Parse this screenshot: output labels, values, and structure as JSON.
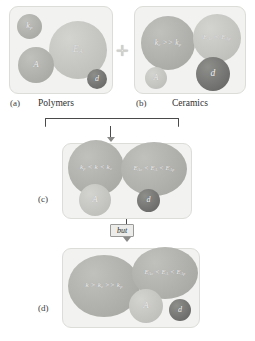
{
  "figure": {
    "type": "four-panel-schematic"
  },
  "panels": [
    {
      "id": "a",
      "panel_letter": "(a)",
      "caption": "Polymers",
      "bubbles": [
        {
          "name": "k-p",
          "label": "k",
          "sub": "p",
          "tone": "mid"
        },
        {
          "name": "activation-energy",
          "label": "E",
          "sub": "A",
          "tone": "light"
        },
        {
          "name": "area",
          "label": "A",
          "sub": "",
          "tone": "mid"
        },
        {
          "name": "thickness",
          "label": "d",
          "sub": "",
          "tone": "dark"
        }
      ]
    },
    {
      "id": "b",
      "panel_letter": "(b)",
      "caption": "Ceramics",
      "bubbles": [
        {
          "name": "k-comparison",
          "label": "k_c >> k_p",
          "tone": "mid"
        },
        {
          "name": "activation-energy-comparison",
          "label": "E_Ac < E_Ap",
          "tone": "light"
        },
        {
          "name": "area",
          "label": "A",
          "sub": "",
          "tone": "light"
        },
        {
          "name": "thickness",
          "label": "d",
          "sub": "",
          "tone": "dark"
        }
      ]
    },
    {
      "id": "c",
      "panel_letter": "(c)",
      "caption": "",
      "bubbles": [
        {
          "name": "k-range",
          "label": "k_p < k < k_c",
          "tone": "mid"
        },
        {
          "name": "activation-energy-range",
          "label": "E_Ac < E_A < E_Ap",
          "tone": "mid"
        },
        {
          "name": "area",
          "label": "A",
          "sub": "",
          "tone": "light"
        },
        {
          "name": "thickness",
          "label": "d",
          "sub": "",
          "tone": "dark"
        }
      ]
    },
    {
      "id": "d",
      "panel_letter": "(d)",
      "caption": "",
      "bubbles": [
        {
          "name": "k-superior",
          "label": "k > k_c >> k_p",
          "tone": "mid"
        },
        {
          "name": "activation-energy-range",
          "label": "E_Ac < E_A < E_Ap",
          "tone": "mid"
        },
        {
          "name": "area",
          "label": "A",
          "sub": "",
          "tone": "light"
        },
        {
          "name": "thickness",
          "label": "d",
          "sub": "",
          "tone": "dark"
        }
      ]
    }
  ],
  "connectors": {
    "plus": "✛",
    "but_label": "but"
  },
  "symbols": {
    "k_p": "k_p",
    "k_c": "k_c",
    "k": "k",
    "E_A": "E_A",
    "E_Ac": "E_Ac",
    "E_Ap": "E_Ap",
    "A": "A",
    "d": "d"
  },
  "colors": {
    "panel_bg": "#f2f2f0",
    "panel_border": "#dcdcd8",
    "bubble_light": "#c9c9c6",
    "bubble_mid": "#b0b0ad",
    "bubble_dark": "#737371",
    "text": "#3a3a3a"
  }
}
